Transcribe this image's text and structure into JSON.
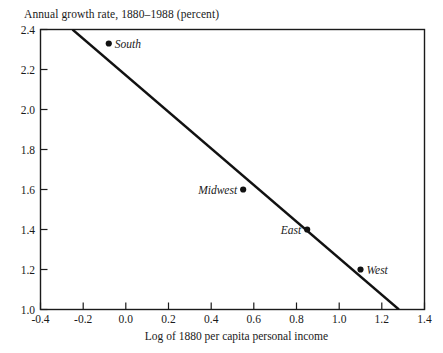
{
  "chart_data": {
    "type": "scatter",
    "title": "Annual growth rate, 1880–1988 (percent)",
    "xlabel": "Log of 1880 per capita personal income",
    "ylabel": "Annual growth rate, 1880–1988 (percent)",
    "xlim": [
      -0.4,
      1.4
    ],
    "ylim": [
      1.0,
      2.4
    ],
    "xticks": [
      "-0.4",
      "-0.2",
      "0.0",
      "0.2",
      "0.4",
      "0.6",
      "0.8",
      "1.0",
      "1.2",
      "1.4"
    ],
    "xtick_values": [
      -0.4,
      -0.2,
      0.0,
      0.2,
      0.4,
      0.6,
      0.8,
      1.0,
      1.2,
      1.4
    ],
    "yticks": [
      "1.0",
      "1.2",
      "1.4",
      "1.6",
      "1.8",
      "2.0",
      "2.2",
      "2.4"
    ],
    "ytick_values": [
      1.0,
      1.2,
      1.4,
      1.6,
      1.8,
      2.0,
      2.2,
      2.4
    ],
    "grid": false,
    "legend": "none",
    "points": [
      {
        "label": "South",
        "x": -0.08,
        "y": 2.33,
        "label_side": "right"
      },
      {
        "label": "Midwest",
        "x": 0.55,
        "y": 1.6,
        "label_side": "left"
      },
      {
        "label": "East",
        "x": 0.85,
        "y": 1.4,
        "label_side": "left"
      },
      {
        "label": "West",
        "x": 1.1,
        "y": 1.2,
        "label_side": "right"
      }
    ],
    "annotations": [
      {
        "type": "regression-line",
        "name": "fitted-regression-line",
        "x_start": -0.25,
        "y_start": 2.4,
        "x_end": 1.28,
        "y_end": 1.0
      }
    ],
    "colors": {
      "frame": "#1a1a1a",
      "line": "#111111",
      "marker": "#111111",
      "text": "#1a1a1a",
      "background": "#ffffff"
    }
  }
}
